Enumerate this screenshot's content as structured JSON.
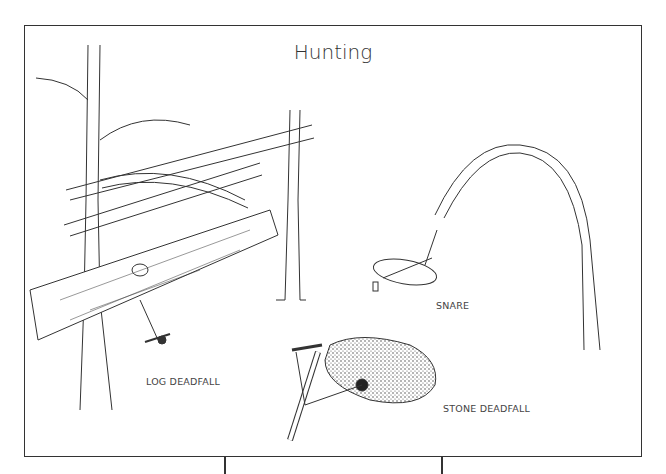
{
  "title": "Hunting",
  "illustrations": [
    {
      "id": "log-deadfall",
      "label": "LOG DEADFALL"
    },
    {
      "id": "snare",
      "label": "SNARE"
    },
    {
      "id": "stone-deadfall",
      "label": "STONE DEADFALL"
    }
  ],
  "colors": {
    "ink": "#333333",
    "background": "#ffffff"
  }
}
